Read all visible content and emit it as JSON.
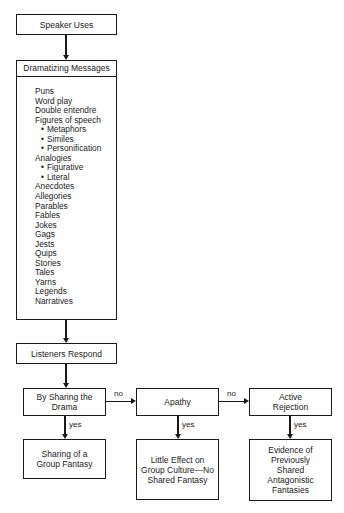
{
  "diagram": {
    "nodes": {
      "speaker": "Speaker Uses",
      "drama_header": "Dramatizing Messages",
      "listeners": "Listeners Respond",
      "sharing_drama": "By Sharing the Drama",
      "apathy": "Apathy",
      "active_rejection": "Active Rejection",
      "group_fantasy": "Sharing of a Group Fantasy",
      "little_effect": "Little Effect on Group Culture—No Shared Fantasy",
      "evidence": "Evidence of Previously Shared Antagonistic Fantasies"
    },
    "drama_items": [
      {
        "text": "Puns",
        "sub": false
      },
      {
        "text": "Word play",
        "sub": false
      },
      {
        "text": "Double entendre",
        "sub": false
      },
      {
        "text": "Figures of speech",
        "sub": false
      },
      {
        "text": "Metaphors",
        "sub": true
      },
      {
        "text": "Similes",
        "sub": true
      },
      {
        "text": "Personification",
        "sub": true
      },
      {
        "text": "Analogies",
        "sub": false
      },
      {
        "text": "Figurative",
        "sub": true
      },
      {
        "text": "Literal",
        "sub": true
      },
      {
        "text": "Anecdotes",
        "sub": false
      },
      {
        "text": "Allegories",
        "sub": false
      },
      {
        "text": "Parables",
        "sub": false
      },
      {
        "text": "Fables",
        "sub": false
      },
      {
        "text": "Jokes",
        "sub": false
      },
      {
        "text": "Gags",
        "sub": false
      },
      {
        "text": "Jests",
        "sub": false
      },
      {
        "text": "Quips",
        "sub": false
      },
      {
        "text": "Stories",
        "sub": false
      },
      {
        "text": "Tales",
        "sub": false
      },
      {
        "text": "Yarns",
        "sub": false
      },
      {
        "text": "Legends",
        "sub": false
      },
      {
        "text": "Narratives",
        "sub": false
      }
    ],
    "edge_labels": {
      "no1": "no",
      "no2": "no",
      "yes1": "yes",
      "yes2": "yes",
      "yes3": "yes"
    }
  }
}
